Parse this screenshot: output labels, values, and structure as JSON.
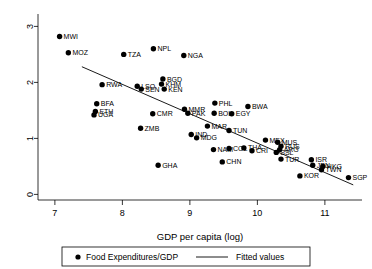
{
  "chart_data": {
    "type": "scatter",
    "title": "",
    "xlabel": "GDP per capita (log)",
    "ylabel": "",
    "xlim": [
      6.75,
      11.55
    ],
    "ylim": [
      -0.1,
      3.15
    ],
    "xticks": [
      "7",
      "8",
      "9",
      "10",
      "11"
    ],
    "xtick_values": [
      7,
      8,
      9,
      10,
      11
    ],
    "yticks": [
      "0",
      "1",
      "2",
      "3"
    ],
    "ytick_values": [
      0,
      1,
      2,
      3
    ],
    "grid": false,
    "legend_position": "below-axis",
    "series": [
      {
        "name": "Food Expenditures/GDP",
        "marker": "filled-circle",
        "color": "#000000",
        "points": [
          {
            "label": "MWI",
            "x": 7.07,
            "y": 2.82
          },
          {
            "label": "MOZ",
            "x": 7.2,
            "y": 2.53
          },
          {
            "label": "TZA",
            "x": 8.02,
            "y": 2.5
          },
          {
            "label": "NPL",
            "x": 8.46,
            "y": 2.6
          },
          {
            "label": "NGA",
            "x": 8.91,
            "y": 2.48
          },
          {
            "label": "RWA",
            "x": 7.7,
            "y": 1.96
          },
          {
            "label": "LSO",
            "x": 8.22,
            "y": 1.93
          },
          {
            "label": "SEN",
            "x": 8.28,
            "y": 1.88
          },
          {
            "label": "BGD",
            "x": 8.6,
            "y": 2.06
          },
          {
            "label": "KHM",
            "x": 8.58,
            "y": 1.97
          },
          {
            "label": "KEN",
            "x": 8.62,
            "y": 1.88
          },
          {
            "label": "BFA",
            "x": 7.62,
            "y": 1.62
          },
          {
            "label": "ETH",
            "x": 7.6,
            "y": 1.48
          },
          {
            "label": "UGA",
            "x": 7.58,
            "y": 1.42
          },
          {
            "label": "CMR",
            "x": 8.45,
            "y": 1.44
          },
          {
            "label": "MMR",
            "x": 8.92,
            "y": 1.52
          },
          {
            "label": "PAK",
            "x": 8.97,
            "y": 1.45
          },
          {
            "label": "PHL",
            "x": 9.37,
            "y": 1.63
          },
          {
            "label": "BOL",
            "x": 9.36,
            "y": 1.45
          },
          {
            "label": "EGY",
            "x": 9.62,
            "y": 1.44
          },
          {
            "label": "BWA",
            "x": 9.86,
            "y": 1.57
          },
          {
            "label": "ZMB",
            "x": 8.27,
            "y": 1.18
          },
          {
            "label": "MAR",
            "x": 9.26,
            "y": 1.22
          },
          {
            "label": "IND",
            "x": 9.02,
            "y": 1.07
          },
          {
            "label": "MDG",
            "x": 9.1,
            "y": 1.01
          },
          {
            "label": "TUN",
            "x": 9.58,
            "y": 1.14
          },
          {
            "label": "GHA",
            "x": 8.53,
            "y": 0.52
          },
          {
            "label": "CHN",
            "x": 9.48,
            "y": 0.58
          },
          {
            "label": "NAM",
            "x": 9.35,
            "y": 0.8
          },
          {
            "label": "COL",
            "x": 9.58,
            "y": 0.82
          },
          {
            "label": "THA",
            "x": 9.8,
            "y": 0.83
          },
          {
            "label": "CRI",
            "x": 9.92,
            "y": 0.78
          },
          {
            "label": "MEX",
            "x": 10.12,
            "y": 0.97
          },
          {
            "label": "MUS",
            "x": 10.3,
            "y": 0.93
          },
          {
            "label": "RUS",
            "x": 10.35,
            "y": 0.86
          },
          {
            "label": "ARG",
            "x": 10.33,
            "y": 0.8
          },
          {
            "label": "SSL",
            "x": 10.28,
            "y": 0.75
          },
          {
            "label": "TUR",
            "x": 10.35,
            "y": 0.63
          },
          {
            "label": "ISR",
            "x": 10.8,
            "y": 0.62
          },
          {
            "label": "JPN",
            "x": 10.82,
            "y": 0.52
          },
          {
            "label": "HKG",
            "x": 10.97,
            "y": 0.5
          },
          {
            "label": "TWN",
            "x": 10.95,
            "y": 0.44
          },
          {
            "label": "KOR",
            "x": 10.63,
            "y": 0.33
          },
          {
            "label": "SGP",
            "x": 11.35,
            "y": 0.3
          }
        ]
      }
    ],
    "fitted_line": {
      "name": "Fitted values",
      "style": "solid",
      "color": "#000000",
      "x_start": 7.4,
      "y_start": 2.28,
      "x_end": 11.42,
      "y_end": 0.17
    }
  },
  "legend": {
    "marker_label": "Food Expenditures/GDP",
    "line_label": "Fitted values"
  }
}
